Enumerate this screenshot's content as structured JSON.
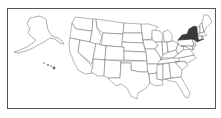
{
  "map": {
    "title": "United States map",
    "highlighted_states": [
      "New York"
    ],
    "colors": {
      "highlight": "#3a3a3a",
      "default_fill": "#ffffff",
      "border": "#6a6a6a",
      "frame": "#555555"
    },
    "insets": [
      "Alaska",
      "Hawaii"
    ]
  }
}
